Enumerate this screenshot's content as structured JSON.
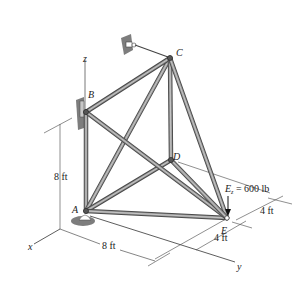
{
  "diagram": {
    "axes": {
      "x_label": "x",
      "y_label": "y",
      "z_label": "z"
    },
    "joints": {
      "A": "A",
      "B": "B",
      "C": "C",
      "D": "D",
      "E": "E"
    },
    "load": {
      "label": "E",
      "subscript": "z",
      "text": " = 600 lb",
      "value_lb": 600
    },
    "dimensions": {
      "height": "8 ft",
      "length_x": "8 ft",
      "e_offset_1": "4 ft",
      "e_offset_2": "4 ft"
    },
    "members": [
      "AB",
      "AC",
      "AD",
      "AE",
      "BC",
      "BE",
      "CD",
      "CE",
      "DE"
    ],
    "colors": {
      "member": "#9a9a9a",
      "member_edge": "#4a4a4a",
      "support": "#7d7d7d",
      "line": "#333333"
    }
  }
}
